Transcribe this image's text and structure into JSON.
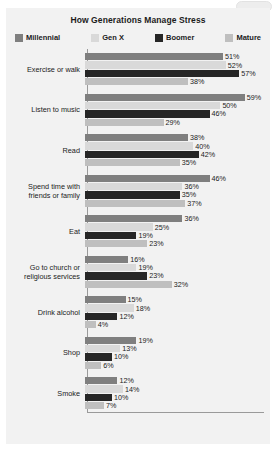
{
  "chart_data": {
    "type": "bar",
    "orientation": "horizontal",
    "title": "How Generations Manage Stress",
    "xlabel": "",
    "ylabel": "",
    "xlim": [
      0,
      65
    ],
    "grid": false,
    "legend_position": "top",
    "value_suffix": "%",
    "categories": [
      "Exercise or walk",
      "Listen to music",
      "Read",
      "Spend time with friends or family",
      "Eat",
      "Go to church or religious services",
      "Drink alcohol",
      "Shop",
      "Smoke"
    ],
    "series": [
      {
        "name": "Millennial",
        "color": "#7f7f7f",
        "values": [
          51,
          59,
          38,
          46,
          36,
          16,
          15,
          19,
          12
        ]
      },
      {
        "name": "Gen X",
        "color": "#d9d9d9",
        "values": [
          52,
          50,
          40,
          36,
          25,
          19,
          18,
          13,
          14
        ]
      },
      {
        "name": "Boomer",
        "color": "#262626",
        "values": [
          57,
          46,
          42,
          35,
          19,
          23,
          12,
          10,
          10
        ]
      },
      {
        "name": "Mature",
        "color": "#bfbfbf",
        "values": [
          38,
          29,
          35,
          37,
          23,
          32,
          4,
          6,
          7
        ]
      }
    ]
  },
  "category_lines": [
    [
      "Exercise or walk"
    ],
    [
      "Listen to music"
    ],
    [
      "Read"
    ],
    [
      "Spend time with",
      "friends or family"
    ],
    [
      "Eat"
    ],
    [
      "Go to church or",
      "religious services"
    ],
    [
      "Drink alcohol"
    ],
    [
      "Shop"
    ],
    [
      "Smoke"
    ]
  ],
  "panel": {
    "background": "#f2f2f2",
    "axis_color": "#9a9a9a"
  }
}
